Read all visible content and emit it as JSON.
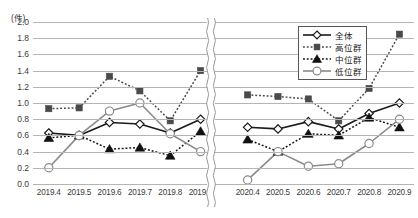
{
  "axis": {
    "unit_label": "(件)",
    "y_ticks": [
      "2.0",
      "1.8",
      "1.6",
      "1.4",
      "1.2",
      "1.0",
      "0.8",
      "0.6",
      "0.4",
      "0.2",
      "0.0"
    ],
    "x_ticks": [
      "2019.4",
      "2019.5",
      "2019.6",
      "2019.7",
      "2019.8",
      "2019.9",
      "2020.4",
      "2020.5",
      "2020.6",
      "2020.7",
      "2020.8",
      "2020.9"
    ],
    "break_after_index": 5
  },
  "legend": {
    "position": "top-right",
    "entries": [
      {
        "label": "全体",
        "marker": "diamond-open",
        "line": "solid",
        "color": "#1a1a1a"
      },
      {
        "label": "高位群",
        "marker": "square-filled",
        "line": "dotted",
        "color": "#4a4a4a"
      },
      {
        "label": "中位群",
        "marker": "triangle-filled",
        "line": "dotted",
        "color": "#111111"
      },
      {
        "label": "低位群",
        "marker": "circle-open",
        "line": "solid",
        "color": "#8a8a8a"
      }
    ]
  },
  "colors": {
    "gridline": "#b4b4b4",
    "text": "#3a3a3a",
    "zentai": "#1a1a1a",
    "koui": "#4a4a4a",
    "chui": "#111111",
    "teii": "#8a8a8a"
  },
  "chart_data": {
    "type": "line",
    "title": "",
    "xlabel": "",
    "ylabel": "(件)",
    "ylim": [
      0.0,
      2.0
    ],
    "ytick_step": 0.2,
    "grid": true,
    "legend_position": "top-right",
    "axis_break": true,
    "categories": [
      "2019.4",
      "2019.5",
      "2019.6",
      "2019.7",
      "2019.8",
      "2019.9",
      "2020.4",
      "2020.5",
      "2020.6",
      "2020.7",
      "2020.8",
      "2020.9"
    ],
    "series": [
      {
        "name": "全体",
        "marker": "diamond-open",
        "line": "solid",
        "color": "#1a1a1a",
        "values": [
          0.63,
          0.6,
          0.76,
          0.74,
          0.63,
          0.8,
          0.7,
          0.68,
          0.77,
          0.68,
          0.87,
          1.0
        ]
      },
      {
        "name": "高位群",
        "marker": "square-filled",
        "line": "dotted",
        "color": "#4a4a4a",
        "values": [
          0.93,
          0.94,
          1.33,
          1.15,
          0.78,
          1.4,
          1.1,
          1.08,
          1.05,
          0.78,
          1.18,
          1.85
        ]
      },
      {
        "name": "中位群",
        "marker": "triangle-filled",
        "line": "dotted",
        "color": "#111111",
        "values": [
          0.57,
          0.6,
          0.43,
          0.45,
          0.35,
          0.65,
          0.55,
          0.4,
          0.62,
          0.6,
          0.82,
          0.7
        ]
      },
      {
        "name": "低位群",
        "marker": "circle-open",
        "line": "solid",
        "color": "#8a8a8a",
        "values": [
          0.2,
          0.6,
          0.9,
          1.0,
          0.62,
          0.4,
          0.05,
          0.4,
          0.22,
          0.25,
          0.5,
          0.8
        ]
      }
    ]
  }
}
